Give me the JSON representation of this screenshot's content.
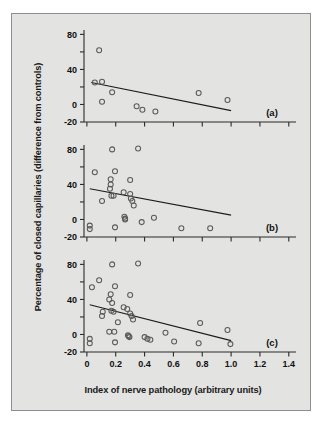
{
  "figure": {
    "background_color": "#e3e3e1",
    "border_color": "#8e8e8c",
    "ylabel": "Percentage of closed capillaries  (difference from controls)",
    "xlabel": "Index of nerve pathology (arbitrary units)"
  },
  "chart_data": {
    "type": "scatter",
    "title": "",
    "xlabel": "Index of nerve pathology (arbitrary units)",
    "ylabel": "Percentage of closed capillaries  (difference from controls)",
    "xlim": [
      -0.02,
      1.45
    ],
    "ylim": [
      -20,
      85
    ],
    "grid": false,
    "legend": null,
    "xticks": [
      0,
      0.2,
      0.4,
      0.6,
      0.8,
      1.0,
      1.2,
      1.4
    ],
    "xtick_labels": [
      "0",
      "0.2",
      "0.4",
      "0.6",
      "0.8",
      "1.0",
      "1.2",
      "1.4"
    ],
    "yticks": [
      -20,
      0,
      20,
      40,
      60,
      80
    ],
    "ytick_labels": [
      "-20",
      "0",
      "",
      "40",
      "",
      "80"
    ],
    "marker": "open-circle",
    "marker_color": "#5a5a5a",
    "panels": [
      {
        "tag": "(a)",
        "n_points": 11,
        "points": [
          {
            "x": 0.085,
            "y": 62
          },
          {
            "x": 0.055,
            "y": 25
          },
          {
            "x": 0.105,
            "y": 26
          },
          {
            "x": 0.105,
            "y": 3
          },
          {
            "x": 0.175,
            "y": 14
          },
          {
            "x": 0.345,
            "y": -2
          },
          {
            "x": 0.385,
            "y": -6
          },
          {
            "x": 0.475,
            "y": -8
          },
          {
            "x": 0.775,
            "y": 13
          },
          {
            "x": 0.975,
            "y": 5
          }
        ],
        "fit_line": {
          "x0": 0.03,
          "y0": 25,
          "x1": 1.0,
          "y1": -7
        }
      },
      {
        "tag": "(b)",
        "n_points": 29,
        "points": [
          {
            "x": 0.175,
            "y": 80
          },
          {
            "x": 0.355,
            "y": 81
          },
          {
            "x": 0.055,
            "y": 54
          },
          {
            "x": 0.195,
            "y": 55
          },
          {
            "x": 0.165,
            "y": 46
          },
          {
            "x": 0.165,
            "y": 40
          },
          {
            "x": 0.16,
            "y": 35
          },
          {
            "x": 0.3,
            "y": 45
          },
          {
            "x": 0.105,
            "y": 21
          },
          {
            "x": 0.17,
            "y": 27
          },
          {
            "x": 0.185,
            "y": 27
          },
          {
            "x": 0.255,
            "y": 31
          },
          {
            "x": 0.3,
            "y": 29
          },
          {
            "x": 0.305,
            "y": 24
          },
          {
            "x": 0.315,
            "y": 21
          },
          {
            "x": 0.325,
            "y": 16
          },
          {
            "x": 0.26,
            "y": 3
          },
          {
            "x": 0.265,
            "y": 1
          },
          {
            "x": 0.265,
            "y": 0
          },
          {
            "x": 0.38,
            "y": -3
          },
          {
            "x": 0.465,
            "y": 2
          },
          {
            "x": 0.02,
            "y": -7
          },
          {
            "x": 0.02,
            "y": -11
          },
          {
            "x": 0.195,
            "y": -9
          },
          {
            "x": 0.655,
            "y": -10
          },
          {
            "x": 0.855,
            "y": -10
          }
        ],
        "fit_line": {
          "x0": 0.02,
          "y0": 35,
          "x1": 1.0,
          "y1": 5
        }
      },
      {
        "tag": "(c)",
        "n_points": 40,
        "points": [
          {
            "x": 0.175,
            "y": 80
          },
          {
            "x": 0.355,
            "y": 81
          },
          {
            "x": 0.085,
            "y": 62
          },
          {
            "x": 0.035,
            "y": 54
          },
          {
            "x": 0.195,
            "y": 55
          },
          {
            "x": 0.165,
            "y": 46
          },
          {
            "x": 0.155,
            "y": 40
          },
          {
            "x": 0.175,
            "y": 36
          },
          {
            "x": 0.3,
            "y": 45
          },
          {
            "x": 0.105,
            "y": 21
          },
          {
            "x": 0.11,
            "y": 26
          },
          {
            "x": 0.17,
            "y": 27
          },
          {
            "x": 0.185,
            "y": 26
          },
          {
            "x": 0.255,
            "y": 31
          },
          {
            "x": 0.28,
            "y": 29
          },
          {
            "x": 0.3,
            "y": 24
          },
          {
            "x": 0.31,
            "y": 21
          },
          {
            "x": 0.32,
            "y": 17
          },
          {
            "x": 0.215,
            "y": 14
          },
          {
            "x": 0.155,
            "y": 3
          },
          {
            "x": 0.19,
            "y": 3
          },
          {
            "x": 0.285,
            "y": -1
          },
          {
            "x": 0.29,
            "y": -2
          },
          {
            "x": 0.295,
            "y": -3
          },
          {
            "x": 0.4,
            "y": -3
          },
          {
            "x": 0.42,
            "y": -5
          },
          {
            "x": 0.44,
            "y": -6
          },
          {
            "x": 0.545,
            "y": 2
          },
          {
            "x": 0.785,
            "y": 13
          },
          {
            "x": 0.975,
            "y": 5
          },
          {
            "x": 0.02,
            "y": -5
          },
          {
            "x": 0.02,
            "y": -10
          },
          {
            "x": 0.195,
            "y": -9
          },
          {
            "x": 0.605,
            "y": -8
          },
          {
            "x": 0.775,
            "y": -10
          },
          {
            "x": 0.995,
            "y": -11
          }
        ],
        "fit_line": {
          "x0": 0.02,
          "y0": 34,
          "x1": 1.0,
          "y1": -7
        }
      }
    ]
  }
}
